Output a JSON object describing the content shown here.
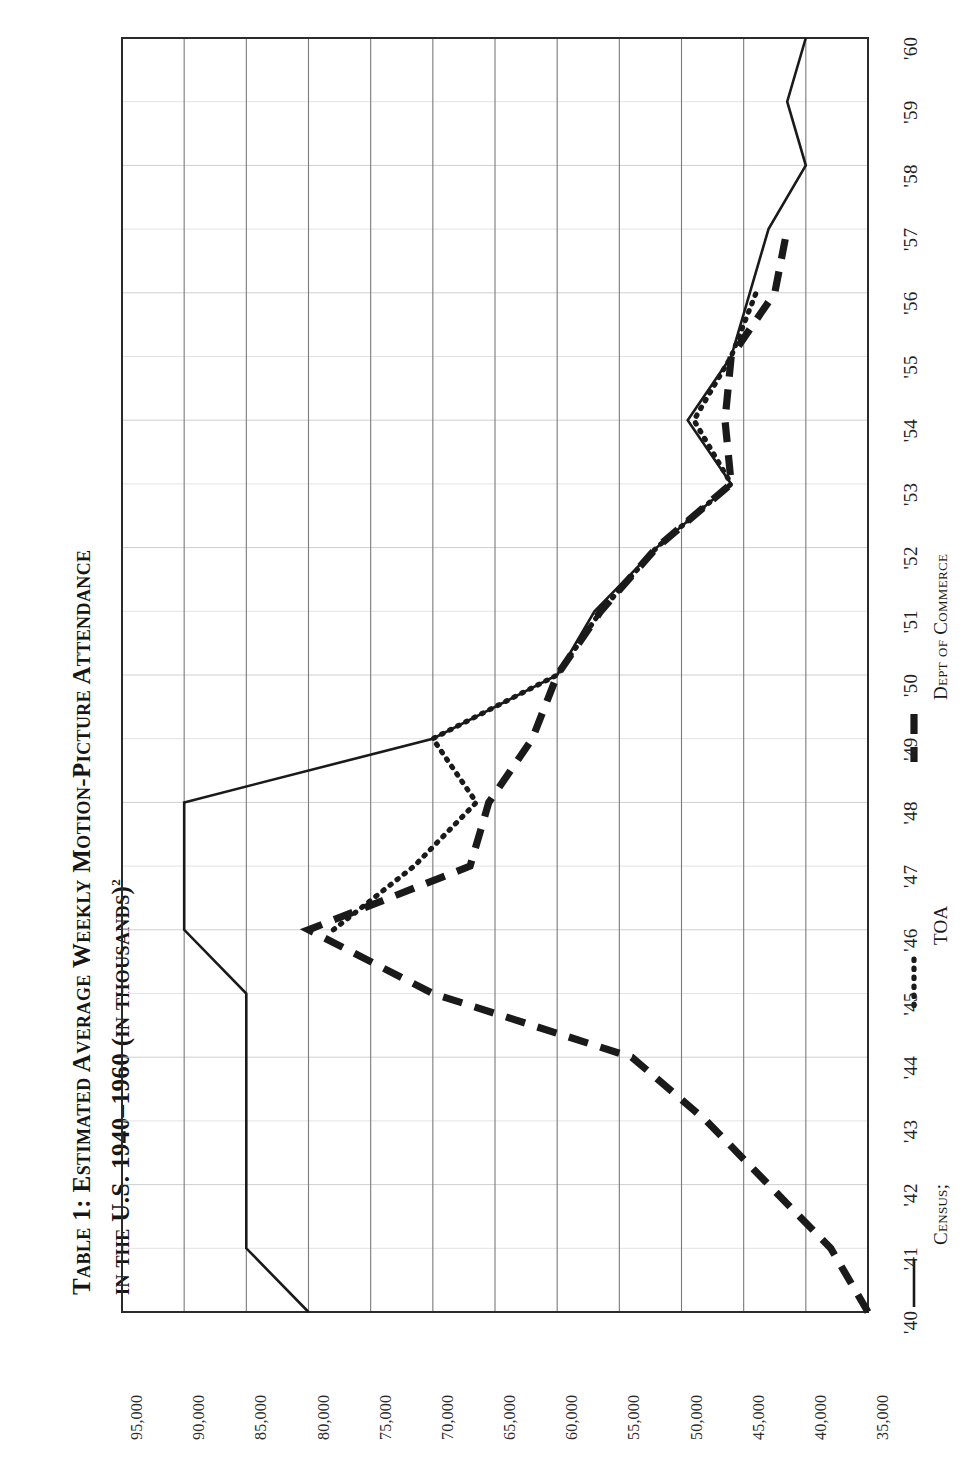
{
  "title": {
    "line1": "Table 1:  Estimated Average Weekly Motion-Picture Attendance",
    "line2": "in the U.S. 1940–1960 (in thousands)",
    "footnote_marker": "2"
  },
  "legend": {
    "position": "bottom-right",
    "items": [
      {
        "label": "Census;",
        "style": "solid",
        "swatch": "solid-line-swatch"
      },
      {
        "label": "TOA",
        "style": "dotted",
        "swatch": "dotted-line-swatch"
      },
      {
        "label": "Dept of Commerce",
        "style": "dashed",
        "swatch": "dashed-line-swatch"
      }
    ]
  },
  "axis": {
    "year_ticks": [
      "'40",
      "'41",
      "'42",
      "'43",
      "'44",
      "'45",
      "'46",
      "'47",
      "'48",
      "'49",
      "'50",
      "'51",
      "'52",
      "'53",
      "'54",
      "'55",
      "'56",
      "'57",
      "'58",
      "'59",
      "'60"
    ],
    "value_ticks": [
      "95,000",
      "90,000",
      "85,000",
      "80,000",
      "75,000",
      "70,000",
      "65,000",
      "60,000",
      "55,000",
      "50,000",
      "45,000",
      "40,000",
      "35,000"
    ]
  },
  "colors": {
    "ink": "#1a1a1a",
    "grid_major": "#7a7a7a",
    "grid_minor": "#cfcfcf",
    "frame": "#2b2b2b",
    "background": "#ffffff"
  },
  "chart_data": {
    "type": "line",
    "title": "Table 1: Estimated Average Weekly Motion-Picture Attendance in the U.S. 1940–1960 (in thousands)",
    "xlabel": "",
    "ylabel": "",
    "orientation": "rotated-90-ccw",
    "grid": true,
    "legend_position": "bottom-right",
    "x": [
      1940,
      1941,
      1942,
      1943,
      1944,
      1945,
      1946,
      1947,
      1948,
      1949,
      1950,
      1951,
      1952,
      1953,
      1954,
      1955,
      1956,
      1957,
      1958,
      1959,
      1960
    ],
    "xtick_labels": [
      "'40",
      "'41",
      "'42",
      "'43",
      "'44",
      "'45",
      "'46",
      "'47",
      "'48",
      "'49",
      "'50",
      "'51",
      "'52",
      "'53",
      "'54",
      "'55",
      "'56",
      "'57",
      "'58",
      "'59",
      "'60"
    ],
    "ylim": [
      35000,
      95000
    ],
    "ytick_values": [
      95000,
      90000,
      85000,
      80000,
      75000,
      70000,
      65000,
      60000,
      55000,
      50000,
      45000,
      40000,
      35000
    ],
    "ytick_labels": [
      "95,000",
      "90,000",
      "85,000",
      "80,000",
      "75,000",
      "70,000",
      "65,000",
      "60,000",
      "55,000",
      "50,000",
      "45,000",
      "40,000",
      "35,000"
    ],
    "series": [
      {
        "name": "Census",
        "style": "solid",
        "x": [
          1940,
          1941,
          1945,
          1946,
          1948,
          1949,
          1950,
          1951,
          1952,
          1953,
          1954,
          1955,
          1957,
          1958,
          1959,
          1960
        ],
        "values": [
          80000,
          85000,
          85000,
          90000,
          90000,
          70000,
          60000,
          57000,
          52000,
          46000,
          49500,
          46000,
          43000,
          40000,
          41500,
          40000
        ]
      },
      {
        "name": "TOA",
        "style": "dotted",
        "x": [
          1946,
          1947,
          1948,
          1949,
          1950,
          1951,
          1952,
          1953,
          1954,
          1955,
          1956
        ],
        "values": [
          78000,
          71500,
          66500,
          70000,
          60000,
          56500,
          52000,
          46000,
          49000,
          46000,
          44000
        ]
      },
      {
        "name": "Dept of Commerce",
        "style": "dashed",
        "x": [
          1940,
          1941,
          1942,
          1943,
          1944,
          1945,
          1946,
          1947,
          1948,
          1949,
          1950,
          1951,
          1952,
          1953,
          1954,
          1955,
          1956,
          1957
        ],
        "values": [
          33500,
          38000,
          43000,
          48000,
          54000,
          70000,
          80000,
          67000,
          65500,
          62000,
          60000,
          56500,
          52000,
          46000,
          46500,
          46000,
          42500,
          41500
        ]
      }
    ]
  }
}
